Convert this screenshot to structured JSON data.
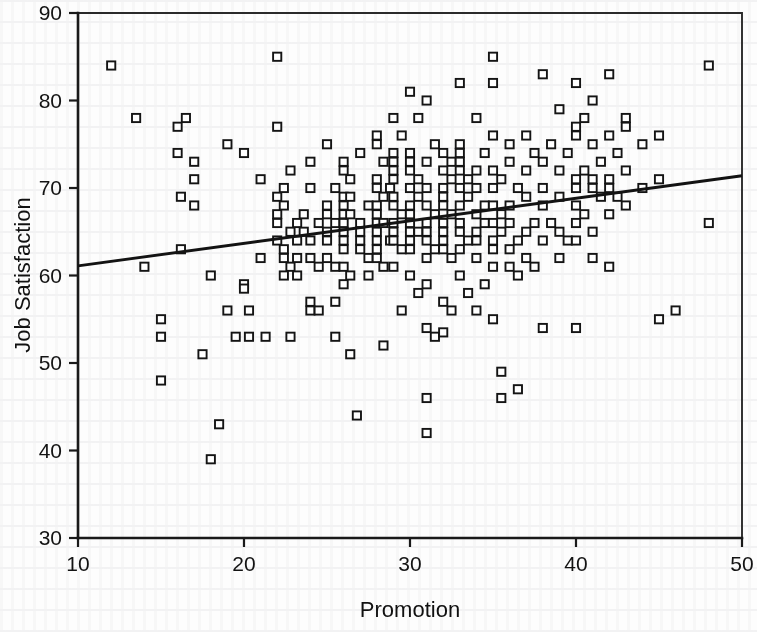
{
  "chart_data": {
    "type": "scatter",
    "title": "",
    "xlabel": "Promotion",
    "ylabel": "Job Satisfaction",
    "xlim": [
      10,
      50
    ],
    "ylim": [
      30,
      90
    ],
    "xticks": [
      10,
      20,
      30,
      40,
      50
    ],
    "yticks": [
      30,
      40,
      50,
      60,
      70,
      80,
      90
    ],
    "xtick_labels": [
      "10",
      "20",
      "30",
      "40",
      "50"
    ],
    "ytick_labels": [
      "30",
      "40",
      "50",
      "60",
      "70",
      "80",
      "90"
    ],
    "grid": false,
    "legend": null,
    "marker": "open-square",
    "marker_color": "#141414",
    "trendline": {
      "type": "linear-regression",
      "x0": 10,
      "y0": 61.1,
      "x1": 50,
      "y1": 71.4,
      "slope": 0.2575,
      "intercept": 58.53,
      "color": "#131313"
    },
    "points": [
      [
        12,
        84
      ],
      [
        13.5,
        78
      ],
      [
        14,
        61
      ],
      [
        15,
        53
      ],
      [
        15,
        55
      ],
      [
        15,
        48
      ],
      [
        16,
        77
      ],
      [
        16,
        74
      ],
      [
        16.5,
        78
      ],
      [
        16.2,
        69
      ],
      [
        16.2,
        63
      ],
      [
        17,
        71
      ],
      [
        17,
        73
      ],
      [
        17,
        68
      ],
      [
        17.5,
        51
      ],
      [
        18,
        60
      ],
      [
        18,
        39
      ],
      [
        18.5,
        43
      ],
      [
        19,
        75
      ],
      [
        19,
        56
      ],
      [
        19.5,
        53
      ],
      [
        20,
        74
      ],
      [
        20,
        59
      ],
      [
        20,
        58.5
      ],
      [
        20.3,
        56
      ],
      [
        20.3,
        53
      ],
      [
        21,
        71
      ],
      [
        21,
        62
      ],
      [
        21.3,
        53
      ],
      [
        22,
        85
      ],
      [
        22,
        77
      ],
      [
        22,
        69
      ],
      [
        22,
        67
      ],
      [
        22,
        66
      ],
      [
        22,
        64
      ],
      [
        22.4,
        70
      ],
      [
        22.4,
        68
      ],
      [
        22.4,
        63
      ],
      [
        22.4,
        62
      ],
      [
        22.4,
        60
      ],
      [
        22.8,
        72
      ],
      [
        22.8,
        65
      ],
      [
        22.8,
        61
      ],
      [
        22.8,
        53
      ],
      [
        23.2,
        66
      ],
      [
        23.2,
        64
      ],
      [
        23.2,
        62
      ],
      [
        23.2,
        60
      ],
      [
        23.6,
        67
      ],
      [
        23.6,
        65
      ],
      [
        24,
        73
      ],
      [
        24,
        70
      ],
      [
        24,
        64
      ],
      [
        24,
        62
      ],
      [
        24,
        57
      ],
      [
        24,
        56
      ],
      [
        24.5,
        66
      ],
      [
        24.5,
        61
      ],
      [
        24.5,
        56
      ],
      [
        25,
        75
      ],
      [
        25,
        68
      ],
      [
        25,
        67
      ],
      [
        25,
        65
      ],
      [
        25,
        64
      ],
      [
        25,
        62
      ],
      [
        25.5,
        70
      ],
      [
        25.5,
        66
      ],
      [
        25.5,
        61
      ],
      [
        25.5,
        57
      ],
      [
        25.5,
        53
      ],
      [
        26,
        73
      ],
      [
        26,
        72
      ],
      [
        26,
        69
      ],
      [
        26,
        68
      ],
      [
        26,
        67
      ],
      [
        26,
        66
      ],
      [
        26,
        65
      ],
      [
        26,
        64
      ],
      [
        26,
        63
      ],
      [
        26,
        61
      ],
      [
        26,
        59
      ],
      [
        26.4,
        71
      ],
      [
        26.4,
        69
      ],
      [
        26.4,
        67
      ],
      [
        26.4,
        60
      ],
      [
        26.4,
        51
      ],
      [
        26.8,
        44
      ],
      [
        27,
        74
      ],
      [
        27,
        66
      ],
      [
        27,
        65
      ],
      [
        27,
        64
      ],
      [
        27,
        63
      ],
      [
        27.5,
        68
      ],
      [
        27.5,
        62
      ],
      [
        27.5,
        60
      ],
      [
        28,
        76
      ],
      [
        28,
        75
      ],
      [
        28,
        71
      ],
      [
        28,
        70
      ],
      [
        28,
        68
      ],
      [
        28,
        67
      ],
      [
        28,
        66
      ],
      [
        28,
        65
      ],
      [
        28,
        64
      ],
      [
        28,
        63
      ],
      [
        28,
        62
      ],
      [
        28.4,
        73
      ],
      [
        28.4,
        69
      ],
      [
        28.4,
        66
      ],
      [
        28.4,
        61
      ],
      [
        28.4,
        52
      ],
      [
        28.8,
        70
      ],
      [
        28.8,
        64
      ],
      [
        29,
        78
      ],
      [
        29,
        74
      ],
      [
        29,
        73
      ],
      [
        29,
        72
      ],
      [
        29,
        71
      ],
      [
        29,
        69
      ],
      [
        29,
        68
      ],
      [
        29,
        66
      ],
      [
        29,
        65
      ],
      [
        29,
        64
      ],
      [
        29,
        61
      ],
      [
        29.5,
        76
      ],
      [
        29.5,
        67
      ],
      [
        29.5,
        63
      ],
      [
        29.5,
        56
      ],
      [
        30,
        81
      ],
      [
        30,
        74
      ],
      [
        30,
        73
      ],
      [
        30,
        72
      ],
      [
        30,
        70
      ],
      [
        30,
        68
      ],
      [
        30,
        67
      ],
      [
        30,
        66
      ],
      [
        30,
        65
      ],
      [
        30,
        64
      ],
      [
        30,
        63
      ],
      [
        30,
        60
      ],
      [
        30.5,
        78
      ],
      [
        30.5,
        71
      ],
      [
        30.5,
        69
      ],
      [
        30.5,
        65
      ],
      [
        30.5,
        58
      ],
      [
        31,
        80
      ],
      [
        31,
        73
      ],
      [
        31,
        70
      ],
      [
        31,
        68
      ],
      [
        31,
        66
      ],
      [
        31,
        65
      ],
      [
        31,
        64
      ],
      [
        31,
        62
      ],
      [
        31,
        59
      ],
      [
        31,
        54
      ],
      [
        31,
        46
      ],
      [
        31,
        42
      ],
      [
        31.5,
        75
      ],
      [
        31.5,
        67
      ],
      [
        31.5,
        63
      ],
      [
        31.5,
        53
      ],
      [
        32,
        74
      ],
      [
        32,
        72
      ],
      [
        32,
        70
      ],
      [
        32,
        69
      ],
      [
        32,
        68
      ],
      [
        32,
        66
      ],
      [
        32,
        65
      ],
      [
        32,
        64
      ],
      [
        32,
        63
      ],
      [
        32,
        57
      ],
      [
        32,
        53.5
      ],
      [
        32.5,
        73
      ],
      [
        32.5,
        71
      ],
      [
        32.5,
        67
      ],
      [
        32.5,
        62
      ],
      [
        32.5,
        56
      ],
      [
        33,
        82
      ],
      [
        33,
        75
      ],
      [
        33,
        74
      ],
      [
        33,
        73
      ],
      [
        33,
        72
      ],
      [
        33,
        70
      ],
      [
        33,
        68
      ],
      [
        33,
        66
      ],
      [
        33,
        65
      ],
      [
        33,
        63
      ],
      [
        33,
        60
      ],
      [
        33.5,
        71
      ],
      [
        33.5,
        69
      ],
      [
        33.5,
        64
      ],
      [
        33.5,
        58
      ],
      [
        34,
        78
      ],
      [
        34,
        72
      ],
      [
        34,
        70
      ],
      [
        34,
        67
      ],
      [
        34,
        65
      ],
      [
        34,
        64
      ],
      [
        34,
        62
      ],
      [
        34,
        56
      ],
      [
        34.5,
        74
      ],
      [
        34.5,
        68
      ],
      [
        34.5,
        66
      ],
      [
        34.5,
        59
      ],
      [
        35,
        85
      ],
      [
        35,
        82
      ],
      [
        35,
        76
      ],
      [
        35,
        72
      ],
      [
        35,
        70
      ],
      [
        35,
        68
      ],
      [
        35,
        66
      ],
      [
        35,
        64
      ],
      [
        35,
        63
      ],
      [
        35,
        61
      ],
      [
        35,
        55
      ],
      [
        35.5,
        71
      ],
      [
        35.5,
        67
      ],
      [
        35.5,
        65
      ],
      [
        35.5,
        49
      ],
      [
        35.5,
        46
      ],
      [
        36,
        75
      ],
      [
        36,
        73
      ],
      [
        36,
        68
      ],
      [
        36,
        66
      ],
      [
        36,
        63
      ],
      [
        36,
        61
      ],
      [
        36.5,
        70
      ],
      [
        36.5,
        64
      ],
      [
        36.5,
        60
      ],
      [
        36.5,
        47
      ],
      [
        37,
        76
      ],
      [
        37,
        72
      ],
      [
        37,
        69
      ],
      [
        37,
        65
      ],
      [
        37,
        62
      ],
      [
        37.5,
        74
      ],
      [
        37.5,
        66
      ],
      [
        37.5,
        61
      ],
      [
        38,
        83
      ],
      [
        38,
        73
      ],
      [
        38,
        70
      ],
      [
        38,
        68
      ],
      [
        38,
        64
      ],
      [
        38,
        54
      ],
      [
        38.5,
        75
      ],
      [
        38.5,
        66
      ],
      [
        39,
        79
      ],
      [
        39,
        72
      ],
      [
        39,
        69
      ],
      [
        39,
        65
      ],
      [
        39,
        62
      ],
      [
        39.5,
        74
      ],
      [
        39.5,
        64
      ],
      [
        40,
        82
      ],
      [
        40,
        77
      ],
      [
        40,
        76
      ],
      [
        40,
        71
      ],
      [
        40,
        70
      ],
      [
        40,
        68
      ],
      [
        40,
        66
      ],
      [
        40,
        64
      ],
      [
        40,
        54
      ],
      [
        40.5,
        78
      ],
      [
        40.5,
        72
      ],
      [
        40.5,
        67
      ],
      [
        41,
        80
      ],
      [
        41,
        75
      ],
      [
        41,
        71
      ],
      [
        41,
        70
      ],
      [
        41,
        65
      ],
      [
        41,
        62
      ],
      [
        41.5,
        73
      ],
      [
        41.5,
        69
      ],
      [
        42,
        83
      ],
      [
        42,
        76
      ],
      [
        42,
        71
      ],
      [
        42,
        70
      ],
      [
        42,
        67
      ],
      [
        42,
        61
      ],
      [
        42.5,
        74
      ],
      [
        42.5,
        69
      ],
      [
        43,
        78
      ],
      [
        43,
        77
      ],
      [
        43,
        72
      ],
      [
        43,
        68
      ],
      [
        44,
        75
      ],
      [
        44,
        70
      ],
      [
        45,
        76
      ],
      [
        45,
        71
      ],
      [
        45,
        55
      ],
      [
        46,
        56
      ],
      [
        48,
        84
      ],
      [
        48,
        66
      ]
    ]
  },
  "axis": {
    "x_axis_name": "x-axis",
    "y_axis_name": "y-axis"
  }
}
